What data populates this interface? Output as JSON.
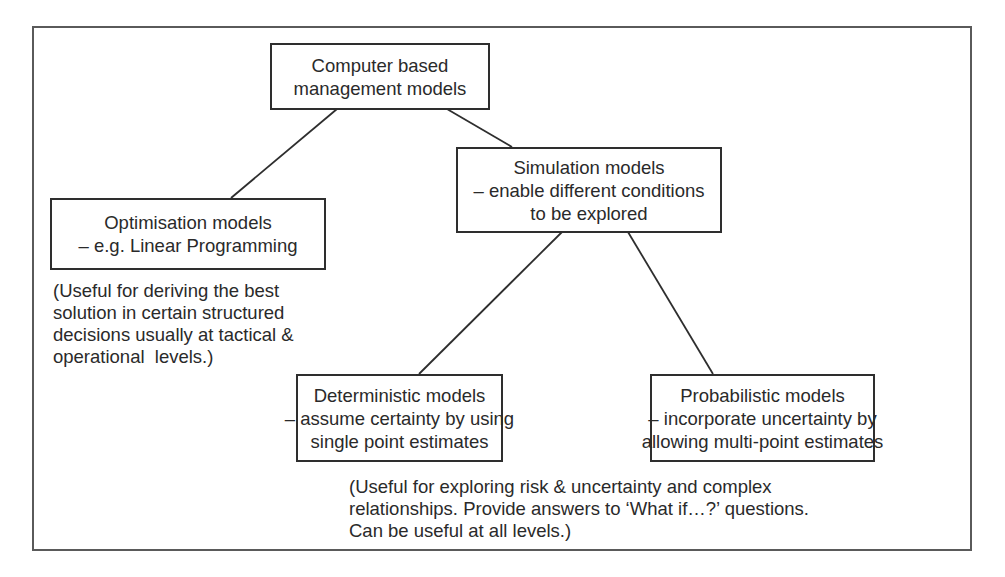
{
  "diagram": {
    "type": "hierarchy-tree",
    "nodes": [
      {
        "id": "root",
        "lines": [
          "Computer based",
          "management models"
        ]
      },
      {
        "id": "optimisation",
        "parent": "root",
        "lines": [
          "Optimisation models",
          "– e.g. Linear Programming"
        ]
      },
      {
        "id": "simulation",
        "parent": "root",
        "lines": [
          "Simulation models",
          "– enable different conditions",
          "to be explored"
        ]
      },
      {
        "id": "deterministic",
        "parent": "simulation",
        "lines": [
          "Deterministic models",
          "– assume certainty by using",
          "single point estimates"
        ]
      },
      {
        "id": "probabilistic",
        "parent": "simulation",
        "lines": [
          "Probabilistic models",
          "– incorporate uncertainty by",
          "allowing multi-point estimates"
        ]
      }
    ],
    "notes": {
      "optimisation": [
        "(Useful for deriving the best",
        "solution in certain structured",
        "decisions usually at tactical &",
        "operational  levels.)"
      ],
      "simulation": [
        "(Useful for exploring risk & uncertainty and complex",
        "relationships. Provide answers to ‘What if…?’ questions.",
        "Can be useful at all levels.)"
      ]
    },
    "edges": [
      {
        "from": "root",
        "to": "optimisation"
      },
      {
        "from": "root",
        "to": "simulation"
      },
      {
        "from": "simulation",
        "to": "deterministic"
      },
      {
        "from": "simulation",
        "to": "probabilistic"
      }
    ],
    "colors": {
      "line": "#2e2e2e",
      "frame": "#5a5a5a",
      "text": "#2a2a2a",
      "background": "#ffffff"
    }
  }
}
